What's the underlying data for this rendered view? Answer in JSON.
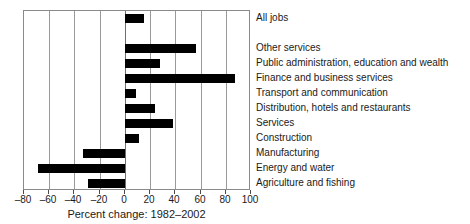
{
  "chart_data": {
    "type": "bar",
    "orientation": "horizontal",
    "title": "",
    "xlabel": "Percent change: 1982–2002",
    "ylabel": "",
    "xlim": [
      -80,
      100
    ],
    "grid": true,
    "legend": "none",
    "xticks": [
      "–80",
      "–60",
      "–40",
      "–20",
      "0",
      "20",
      "40",
      "60",
      "80",
      "100"
    ],
    "xtick_values": [
      -80,
      -60,
      -40,
      -20,
      0,
      20,
      40,
      60,
      80,
      100
    ],
    "categories": [
      "All jobs",
      "",
      "Other services",
      "Public administration, education and wealth",
      "Finance and business services",
      "Transport and communication",
      "Distribution, hotels and restaurants",
      "Services",
      "Construction",
      "Manufacturing",
      "Energy and water",
      "Agriculture and fishing"
    ],
    "values": [
      15,
      null,
      56,
      28,
      87,
      9,
      24,
      38,
      11,
      -33,
      -69,
      -29
    ],
    "bar_color": "#000000"
  },
  "axis": {
    "xlabel": "Percent change: 1982–2002"
  }
}
